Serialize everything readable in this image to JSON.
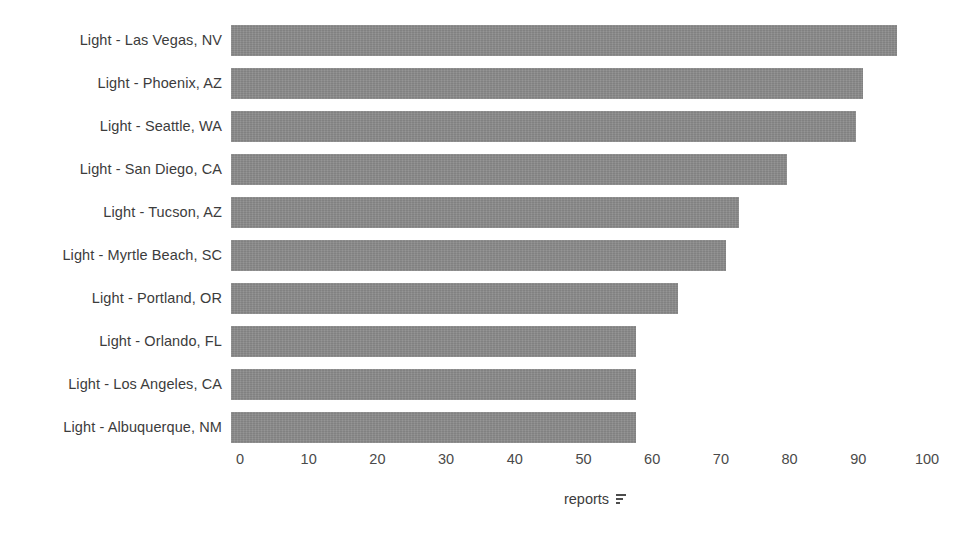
{
  "chart_data": {
    "type": "bar",
    "orientation": "horizontal",
    "title": "",
    "subtitle": "",
    "xlabel": "reports",
    "ylabel": "",
    "xlim": [
      0,
      100
    ],
    "xticks": [
      0,
      10,
      20,
      30,
      40,
      50,
      60,
      70,
      80,
      90,
      100
    ],
    "xtick_labels": [
      "0",
      "10",
      "20",
      "30",
      "40",
      "50",
      "60",
      "70",
      "80",
      "90",
      "100"
    ],
    "grid": false,
    "legend": false,
    "legend_position": "none",
    "sorted": "descending",
    "bar_color": "#8a8a8a",
    "background_color": "#ffffff",
    "text_color": "#3c3c3c",
    "categories": [
      "Light - Las Vegas, NV",
      "Light - Phoenix, AZ",
      "Light - Seattle, WA",
      "Light - San Diego, CA",
      "Light - Tucson, AZ",
      "Light - Myrtle Beach, SC",
      "Light - Portland, OR",
      "Light - Orlando, FL",
      "Light - Los Angeles, CA",
      "Light - Albuquerque, NM"
    ],
    "values": [
      97,
      92,
      91,
      81,
      74,
      72,
      65,
      59,
      59,
      59
    ]
  },
  "axis_title": {
    "text": "reports",
    "sort_icon": "sort-descending-icon"
  }
}
